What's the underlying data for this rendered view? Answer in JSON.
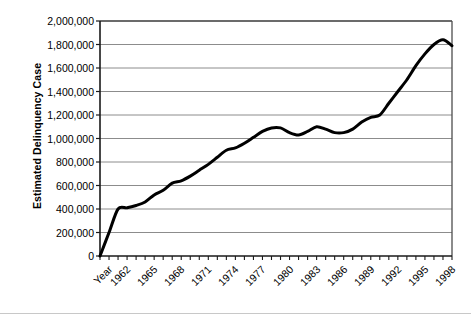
{
  "chart_data": {
    "type": "line",
    "title": "",
    "subtitle": "",
    "xlabel": "Year",
    "ylabel": "Estimated Delinquency Case",
    "xlim": [
      1960,
      1999
    ],
    "ylim": [
      0,
      2000000
    ],
    "grid": true,
    "grid_axis": "y",
    "legend": "none",
    "line_color": "#000000",
    "line_width": 3,
    "ytick_labels": [
      "0",
      "200,000",
      "400,000",
      "600,000",
      "800,000",
      "1,000,000",
      "1,200,000",
      "1,400,000",
      "1,600,000",
      "1,800,000",
      "2,000,000"
    ],
    "ytick_values": [
      0,
      200000,
      400000,
      600000,
      800000,
      1000000,
      1200000,
      1400000,
      1600000,
      1800000,
      2000000
    ],
    "xtick_labels": [
      "Year",
      "1962",
      "1965",
      "1968",
      "1971",
      "1974",
      "1977",
      "1980",
      "1983",
      "1986",
      "1989",
      "1992",
      "1995",
      "1998"
    ],
    "xtick_values": [
      1960,
      1962,
      1965,
      1968,
      1971,
      1974,
      1977,
      1980,
      1983,
      1986,
      1989,
      1992,
      1995,
      1998
    ],
    "x": [
      1960,
      1961,
      1962,
      1963,
      1964,
      1965,
      1966,
      1967,
      1968,
      1969,
      1970,
      1971,
      1972,
      1973,
      1974,
      1975,
      1976,
      1977,
      1978,
      1979,
      1980,
      1981,
      1982,
      1983,
      1984,
      1985,
      1986,
      1987,
      1988,
      1989,
      1990,
      1991,
      1992,
      1993,
      1994,
      1995,
      1996,
      1997,
      1998,
      1999
    ],
    "values": [
      0,
      200000,
      400000,
      410000,
      430000,
      460000,
      520000,
      560000,
      620000,
      640000,
      680000,
      730000,
      780000,
      840000,
      900000,
      920000,
      960000,
      1010000,
      1060000,
      1090000,
      1090000,
      1050000,
      1030000,
      1060000,
      1100000,
      1080000,
      1050000,
      1050000,
      1080000,
      1140000,
      1180000,
      1200000,
      1300000,
      1400000,
      1500000,
      1620000,
      1720000,
      1800000,
      1840000,
      1790000
    ],
    "series_name": "Estimated Delinquency Cases",
    "annotations": []
  },
  "plot_area": {
    "left": 100,
    "top": 21,
    "right": 452,
    "bottom": 256
  }
}
